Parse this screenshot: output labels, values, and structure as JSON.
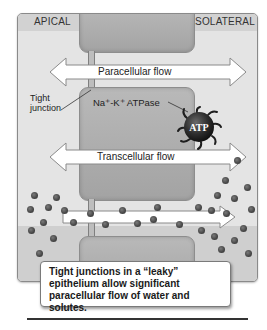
{
  "figure": {
    "side_labels": {
      "apical": "APICAL",
      "basolateral": "BASOLATERAL"
    },
    "arrows": {
      "paracellular": "Paracellular flow",
      "transcellular": "Transcellular flow"
    },
    "annotations": {
      "tight_junction": "Tight\njunction",
      "tight_junction_line1": "Tight",
      "tight_junction_line2": "junction",
      "pump_label": "Na⁺-K⁺ ATPase",
      "pump_badge": "ATP"
    },
    "caption": "Tight junctions in a “leaky” epithelium allow significant paracellular flow of water and solutes.",
    "colors": {
      "panel_bg": "#e4e4e4",
      "cell_fill": "#afafaf",
      "solute_dot": "#4a4a4a",
      "arrow_fill": "#ffffff",
      "pump": "#2b2b2b"
    }
  }
}
